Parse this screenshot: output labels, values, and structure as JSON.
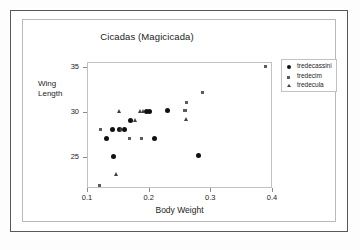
{
  "chart_data": {
    "type": "scatter",
    "title": "Cicadas (Magicicada)",
    "xlabel": "Body Weight",
    "ylabel": "Wing Length",
    "ylabel_line1": "Wing",
    "ylabel_line2": "Length",
    "xlim": [
      0.1,
      0.4
    ],
    "ylim": [
      21.5,
      35.5
    ],
    "xticks": [
      "0.1",
      "0.2",
      "0.3",
      "0.4"
    ],
    "xtick_values": [
      0.1,
      0.2,
      0.3,
      0.4
    ],
    "yticks": [
      "35",
      "30",
      "25"
    ],
    "ytick_values": [
      35,
      30,
      25
    ],
    "grid": false,
    "legend_position": "right-top",
    "series": [
      {
        "name": "tredecassini",
        "marker": "circle",
        "points": [
          [
            0.131,
            27.0
          ],
          [
            0.141,
            28.0
          ],
          [
            0.143,
            25.0
          ],
          [
            0.152,
            28.0
          ],
          [
            0.16,
            28.0
          ],
          [
            0.17,
            29.0
          ],
          [
            0.196,
            30.0
          ],
          [
            0.201,
            30.0
          ],
          [
            0.21,
            27.0
          ],
          [
            0.23,
            30.1
          ],
          [
            0.281,
            25.1
          ]
        ]
      },
      {
        "name": "tredecim",
        "marker": "square",
        "points": [
          [
            0.12,
            21.8
          ],
          [
            0.122,
            28.0
          ],
          [
            0.169,
            27.0
          ],
          [
            0.188,
            27.0
          ],
          [
            0.259,
            30.1
          ],
          [
            0.261,
            31.0
          ],
          [
            0.287,
            32.1
          ],
          [
            0.39,
            35.0
          ]
        ]
      },
      {
        "name": "tredecula",
        "marker": "triangle",
        "points": [
          [
            0.148,
            23.0
          ],
          [
            0.152,
            30.1
          ],
          [
            0.155,
            28.0
          ],
          [
            0.179,
            29.1
          ],
          [
            0.186,
            30.1
          ],
          [
            0.192,
            30.1
          ],
          [
            0.261,
            29.2
          ]
        ]
      }
    ]
  },
  "legend": {
    "items": [
      {
        "label": "tredecassini",
        "marker": "circle"
      },
      {
        "label": "tredecim",
        "marker": "square"
      },
      {
        "label": "tredecula",
        "marker": "triangle"
      }
    ]
  }
}
